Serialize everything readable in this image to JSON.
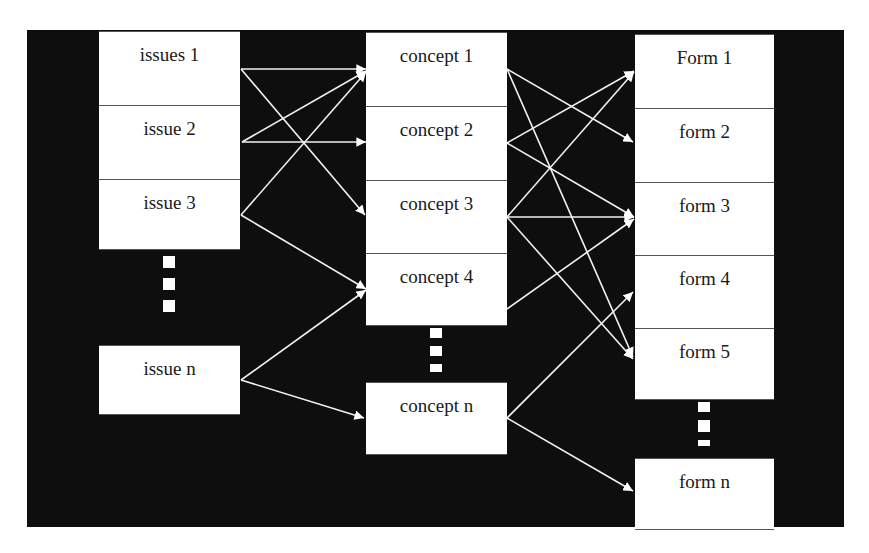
{
  "diagram": {
    "columns": [
      {
        "name": "issues",
        "items": [
          {
            "id": "i1",
            "label": "issues 1"
          },
          {
            "id": "i2",
            "label": "issue 2"
          },
          {
            "id": "i3",
            "label": "issue 3"
          },
          {
            "id": "in",
            "label": "issue n"
          }
        ]
      },
      {
        "name": "concepts",
        "items": [
          {
            "id": "c1",
            "label": "concept 1"
          },
          {
            "id": "c2",
            "label": "concept 2"
          },
          {
            "id": "c3",
            "label": "concept 3"
          },
          {
            "id": "c4",
            "label": "concept 4"
          },
          {
            "id": "cn",
            "label": "concept n"
          }
        ]
      },
      {
        "name": "forms",
        "items": [
          {
            "id": "f1",
            "label": "Form 1"
          },
          {
            "id": "f2",
            "label": "form 2"
          },
          {
            "id": "f3",
            "label": "form 3"
          },
          {
            "id": "f4",
            "label": "form 4"
          },
          {
            "id": "f5",
            "label": "form 5"
          },
          {
            "id": "fn",
            "label": "form n"
          }
        ]
      }
    ],
    "edges": [
      [
        "i1",
        "c1"
      ],
      [
        "i1",
        "c3"
      ],
      [
        "i2",
        "c1"
      ],
      [
        "i2",
        "c2"
      ],
      [
        "i3",
        "c1"
      ],
      [
        "i3",
        "c4"
      ],
      [
        "in",
        "c4"
      ],
      [
        "in",
        "cn"
      ],
      [
        "c1",
        "f2"
      ],
      [
        "c1",
        "f5"
      ],
      [
        "c2",
        "f1"
      ],
      [
        "c2",
        "f3"
      ],
      [
        "c3",
        "f1"
      ],
      [
        "c3",
        "f3"
      ],
      [
        "c3",
        "f5"
      ],
      [
        "c4",
        "f3"
      ],
      [
        "cn",
        "f4"
      ],
      [
        "cn",
        "fn"
      ]
    ],
    "ellipsis_between": [
      [
        "i3",
        "in"
      ],
      [
        "c4",
        "cn"
      ],
      [
        "f5",
        "fn"
      ]
    ],
    "colors": {
      "background": "#0e0e0e",
      "box": "#ffffff",
      "arrow": "#ffffff",
      "text": "#1a1a1a"
    }
  }
}
